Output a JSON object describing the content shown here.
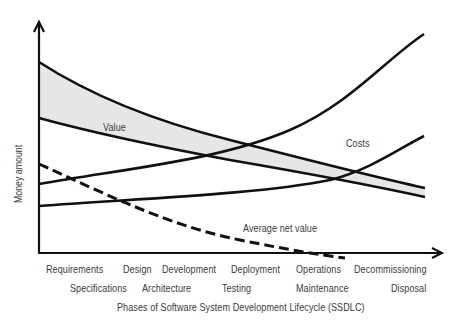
{
  "diagram": {
    "title": "Phases of Software System Development Lifecycle (SSDLC)",
    "x_axis_label": "Phases of Software System Development Lifecycle (SSDLC)",
    "y_axis_label": "Money amount",
    "phases_row1": [
      "Requirements",
      "Design",
      "Development",
      "Deployment",
      "Operations",
      "Decommissioning"
    ],
    "phases_row2": [
      "Specifications",
      "Architecture",
      "Testing",
      "Maintenance",
      "Disposal"
    ],
    "curve_labels": {
      "value": "Value",
      "costs": "Costs",
      "average_net_value": "Average net value"
    },
    "colors": {
      "line": "#111111",
      "value_band_fill": "#e6e6e6",
      "text": "#3a3a3a",
      "background": "#ffffff"
    },
    "series": [
      {
        "name": "Value (upper bound)",
        "style": "solid",
        "trend": "decreasing"
      },
      {
        "name": "Value (lower bound)",
        "style": "solid",
        "trend": "decreasing"
      },
      {
        "name": "Costs (upper bound)",
        "style": "solid",
        "trend": "increasing, exponential"
      },
      {
        "name": "Costs (lower bound)",
        "style": "solid",
        "trend": "increasing"
      },
      {
        "name": "Average net value",
        "style": "dashed",
        "trend": "decreasing, crosses below zero near Operations"
      }
    ]
  }
}
